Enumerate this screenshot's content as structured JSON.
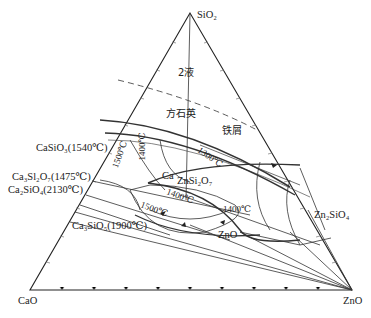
{
  "diagram": {
    "type": "ternary-phase-diagram",
    "vertices": {
      "top": "SiO₂",
      "left": "CaO",
      "right": "ZnO"
    },
    "regions": {
      "two_liquid": "2液",
      "cristobalite": "方石英",
      "tridymite": "铁屑"
    },
    "compounds": {
      "casio3": "CaSiO₃(1540℃)",
      "ca3si2o7": "Ca₃Sl₂O₇(1475℃)",
      "ca2sio4": "Ca₂SiO₄(2130℃)",
      "ca3sio5": "Ca₃SiO₅(1900℃)",
      "ca2znsi2o7_a": "Ca",
      "ca2znsi2o7_b": "ZnSi₂O₇",
      "zn2sio4": "Zn₂SiO₄",
      "zno_field": "ZnO"
    },
    "isotherms": {
      "t1500a": "1500℃",
      "t1400a": "1400℃",
      "t1300": "1300℃",
      "t1400b": "1400℃",
      "t1500b": "1500℃",
      "t1400c": "1400℃"
    }
  }
}
